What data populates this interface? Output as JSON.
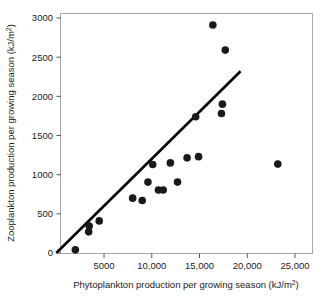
{
  "chart_data": {
    "type": "scatter",
    "title": "",
    "xlabel": "Phytoplankton production per growing season (kJ/m2)",
    "xlabel_main": "Phytoplankton production per growing season (kJ/m",
    "xlabel_sup": "2",
    "xlabel_tail": ")",
    "ylabel": "Zooplankton production per growing season (kJ/m2)",
    "ylabel_main": "Zooplankton production per growing season (kJ/m",
    "ylabel_sup": "2",
    "ylabel_tail": ")",
    "xlim": [
      0,
      26000
    ],
    "ylim": [
      0,
      3150
    ],
    "xticks": [
      5000,
      10000,
      15000,
      20000,
      25000
    ],
    "xtick_labels": [
      "5000",
      "10,000",
      "15,000",
      "20,000",
      "25,000"
    ],
    "yticks": [
      0,
      500,
      1000,
      1500,
      2000,
      2500,
      3000
    ],
    "ytick_labels": [
      "0",
      "500",
      "1000",
      "1500",
      "2000",
      "2500",
      "3000"
    ],
    "grid": false,
    "legend": "none",
    "marker": "filled-circle",
    "marker_color": "#1a1a1a",
    "marker_size": 5,
    "line_color": "#000000",
    "points": [
      {
        "x": 2000,
        "y": 40
      },
      {
        "x": 3400,
        "y": 270
      },
      {
        "x": 3450,
        "y": 345
      },
      {
        "x": 4500,
        "y": 410
      },
      {
        "x": 8000,
        "y": 700
      },
      {
        "x": 9000,
        "y": 670
      },
      {
        "x": 9600,
        "y": 905
      },
      {
        "x": 10100,
        "y": 1130
      },
      {
        "x": 10700,
        "y": 805
      },
      {
        "x": 11200,
        "y": 805
      },
      {
        "x": 11950,
        "y": 1150
      },
      {
        "x": 12700,
        "y": 905
      },
      {
        "x": 13700,
        "y": 1215
      },
      {
        "x": 14600,
        "y": 1740
      },
      {
        "x": 14900,
        "y": 1230
      },
      {
        "x": 16400,
        "y": 2910
      },
      {
        "x": 17300,
        "y": 1780
      },
      {
        "x": 17400,
        "y": 1900
      },
      {
        "x": 17700,
        "y": 2590
      },
      {
        "x": 23200,
        "y": 1135
      }
    ],
    "trendline": {
      "x1": 0,
      "y1": 0,
      "x2": 19300,
      "y2": 2320,
      "description": "least-squares regression line"
    }
  },
  "axes": {
    "frame_color": "#999999",
    "tick_color": "#555555"
  }
}
